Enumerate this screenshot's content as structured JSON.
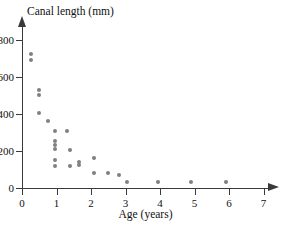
{
  "chart_data": {
    "type": "scatter",
    "title": "Canal length (mm)",
    "xlabel": "Age (years)",
    "ylabel": "Canal length (mm)",
    "xlim": [
      0,
      7.4
    ],
    "ylim": [
      0,
      860
    ],
    "xticks": [
      0,
      1,
      2,
      3,
      4,
      5,
      6,
      7
    ],
    "yticks": [
      0,
      200,
      400,
      600,
      800
    ],
    "xtick_labels": [
      "0",
      "1",
      "2",
      "3",
      "4",
      "5",
      "6",
      "7"
    ],
    "ytick_labels": [
      "0",
      "200",
      "400",
      "600",
      "800"
    ],
    "grid": false,
    "legend": null,
    "marker_color": "#808080",
    "axis_color": "#3a3a3a",
    "points": [
      {
        "x": 0.25,
        "y": 725
      },
      {
        "x": 0.25,
        "y": 692
      },
      {
        "x": 0.5,
        "y": 530
      },
      {
        "x": 0.5,
        "y": 503
      },
      {
        "x": 0.5,
        "y": 405
      },
      {
        "x": 0.75,
        "y": 362
      },
      {
        "x": 0.95,
        "y": 310
      },
      {
        "x": 1.3,
        "y": 310
      },
      {
        "x": 0.95,
        "y": 255
      },
      {
        "x": 0.95,
        "y": 235
      },
      {
        "x": 0.95,
        "y": 212
      },
      {
        "x": 1.4,
        "y": 205
      },
      {
        "x": 0.95,
        "y": 152
      },
      {
        "x": 0.95,
        "y": 120
      },
      {
        "x": 1.4,
        "y": 120
      },
      {
        "x": 1.65,
        "y": 140
      },
      {
        "x": 1.65,
        "y": 122
      },
      {
        "x": 2.08,
        "y": 160
      },
      {
        "x": 2.08,
        "y": 80
      },
      {
        "x": 2.5,
        "y": 82
      },
      {
        "x": 2.8,
        "y": 70
      },
      {
        "x": 3.05,
        "y": 30
      },
      {
        "x": 3.95,
        "y": 30
      },
      {
        "x": 4.9,
        "y": 30
      },
      {
        "x": 5.9,
        "y": 30
      }
    ]
  },
  "chart": {
    "title": "Canal length (mm)",
    "x_axis_title": "Age (years)"
  }
}
